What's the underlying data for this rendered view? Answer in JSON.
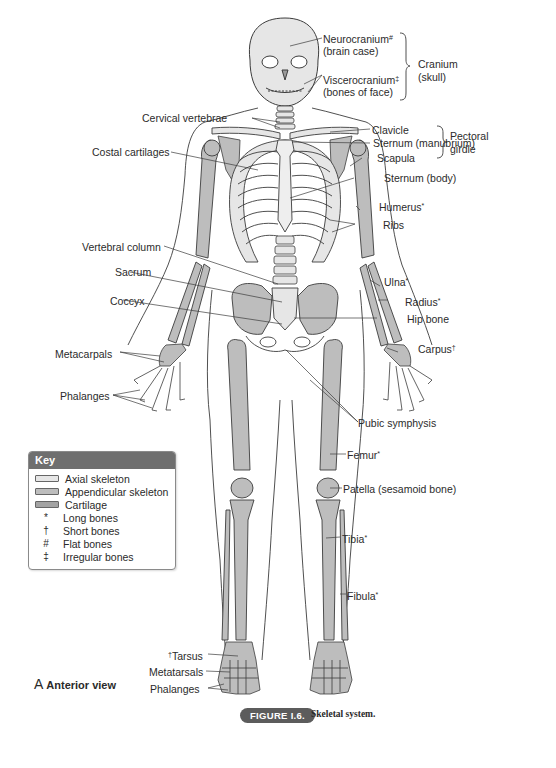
{
  "figure": {
    "view_letter": "A",
    "view_label": "Anterior view",
    "badge": "FIGURE I.6.",
    "caption": "Skeletal system."
  },
  "colors": {
    "axial": "#e6e6e6",
    "appendicular": "#bdbdbd",
    "cartilage": "#a9a9a9",
    "outline": "#3c3c3c",
    "key_header": "#6f6f6f"
  },
  "labels": {
    "neurocranium": "Neurocranium",
    "neurocranium_mark": "#",
    "neurocranium_sub": "(brain case)",
    "viscerocranium": "Viscerocranium",
    "viscerocranium_mark": "‡",
    "viscerocranium_sub": "(bones of face)",
    "cranium": "Cranium",
    "cranium_sub": "(skull)",
    "cervical_vertebrae": "Cervical vertebrae",
    "clavicle": "Clavicle",
    "sternum_manubrium": "Sternum (manubrium)",
    "pectoral": "Pectoral",
    "pectoral_sub": "girdle",
    "costal_cartilages": "Costal cartilages",
    "scapula": "Scapula",
    "sternum_body": "Sternum (body)",
    "humerus": "Humerus",
    "humerus_mark": "*",
    "ribs": "Ribs",
    "vertebral_column": "Vertebral column",
    "ulna": "Ulna",
    "ulna_mark": "*",
    "sacrum": "Sacrum",
    "radius": "Radius",
    "radius_mark": "*",
    "coccyx": "Coccyx",
    "hip_bone": "Hip bone",
    "carpus": "Carpus",
    "carpus_mark": "†",
    "metacarpals": "Metacarpals",
    "phalanges_hand": "Phalanges",
    "pubic_symphysis": "Pubic symphysis",
    "femur": "Femur",
    "femur_mark": "*",
    "patella": "Patella (sesamoid bone)",
    "tibia": "Tibia",
    "tibia_mark": "*",
    "fibula": "Fibula",
    "fibula_mark": "*",
    "tarsus_mark": "†",
    "tarsus": "Tarsus",
    "metatarsals": "Metatarsals",
    "phalanges_foot": "Phalanges"
  },
  "key": {
    "title": "Key",
    "swatches": [
      {
        "label": "Axial skeleton",
        "color": "#e6e6e6"
      },
      {
        "label": "Appendicular skeleton",
        "color": "#bdbdbd"
      },
      {
        "label": "Cartilage",
        "color": "#a3a3a3"
      }
    ],
    "symbols": [
      {
        "symbol": "*",
        "label": "Long bones"
      },
      {
        "symbol": "†",
        "label": "Short bones"
      },
      {
        "symbol": "#",
        "label": "Flat bones"
      },
      {
        "symbol": "‡",
        "label": "Irregular bones"
      }
    ]
  }
}
